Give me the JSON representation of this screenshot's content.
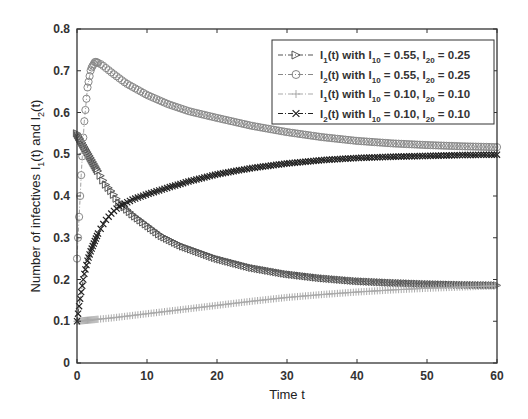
{
  "chart_data": {
    "type": "line",
    "title": "",
    "xlabel": "Time t",
    "ylabel": "Number of infectives I_1(t) and I_2(t)",
    "xlim": [
      0,
      60
    ],
    "ylim": [
      0,
      0.8
    ],
    "xticks": [
      0,
      10,
      20,
      30,
      40,
      50,
      60
    ],
    "yticks": [
      0,
      0.1,
      0.2,
      0.3,
      0.4,
      0.5,
      0.6,
      0.7,
      0.8
    ],
    "xtick_labels": [
      "0",
      "10",
      "20",
      "30",
      "40",
      "50",
      "60"
    ],
    "ytick_labels": [
      "0",
      "0.1",
      "0.2",
      "0.3",
      "0.4",
      "0.5",
      "0.6",
      "0.7",
      "0.8"
    ],
    "grid": false,
    "legend_position": "upper right",
    "series": [
      {
        "name": "I_1(t) with I_10 = 0.55, I_20 = 0.25",
        "marker": "triangle-right",
        "color": "#555555",
        "x": [
          0,
          1,
          2,
          3,
          4,
          5,
          6,
          8,
          10,
          12,
          15,
          20,
          25,
          30,
          35,
          40,
          45,
          50,
          55,
          60
        ],
        "y": [
          0.55,
          0.52,
          0.49,
          0.46,
          0.43,
          0.41,
          0.385,
          0.355,
          0.33,
          0.305,
          0.28,
          0.25,
          0.228,
          0.213,
          0.203,
          0.196,
          0.192,
          0.189,
          0.187,
          0.186
        ]
      },
      {
        "name": "I_2(t) with I_10 = 0.55, I_20 = 0.25",
        "marker": "circle",
        "color": "#888888",
        "x": [
          0,
          0.3,
          0.6,
          1,
          1.5,
          2,
          2.6,
          3.5,
          5,
          7,
          10,
          13,
          16,
          20,
          25,
          30,
          35,
          40,
          45,
          50,
          55,
          60
        ],
        "y": [
          0.25,
          0.35,
          0.45,
          0.57,
          0.66,
          0.705,
          0.722,
          0.715,
          0.695,
          0.67,
          0.642,
          0.62,
          0.603,
          0.587,
          0.568,
          0.553,
          0.541,
          0.532,
          0.526,
          0.522,
          0.519,
          0.517
        ]
      },
      {
        "name": "I_1(t) with I_10 = 0.10, I_20 = 0.10",
        "marker": "plus",
        "color": "#aaaaaa",
        "x": [
          0,
          5,
          10,
          15,
          20,
          25,
          30,
          35,
          40,
          45,
          50,
          55,
          60
        ],
        "y": [
          0.1,
          0.108,
          0.118,
          0.128,
          0.138,
          0.148,
          0.157,
          0.164,
          0.17,
          0.175,
          0.179,
          0.182,
          0.185
        ]
      },
      {
        "name": "I_2(t) with I_10 = 0.10, I_20 = 0.10",
        "marker": "x",
        "color": "#222222",
        "x": [
          0,
          0.5,
          1,
          1.5,
          2,
          3,
          4,
          5,
          6,
          8,
          10,
          13,
          16,
          20,
          25,
          30,
          35,
          40,
          45,
          50,
          55,
          60
        ],
        "y": [
          0.1,
          0.16,
          0.21,
          0.245,
          0.27,
          0.31,
          0.34,
          0.36,
          0.375,
          0.392,
          0.404,
          0.42,
          0.435,
          0.452,
          0.467,
          0.478,
          0.486,
          0.491,
          0.494,
          0.496,
          0.498,
          0.499
        ]
      }
    ]
  },
  "legend": {
    "items": [
      {
        "prefix": "I",
        "sub1": "1",
        "mid": "(t) with I",
        "sub2": "10",
        "mid2": " = 0.55, I",
        "sub3": "20",
        "tail": " = 0.25"
      },
      {
        "prefix": "I",
        "sub1": "2",
        "mid": "(t) with I",
        "sub2": "10",
        "mid2": " = 0.55, I",
        "sub3": "20",
        "tail": " = 0.25"
      },
      {
        "prefix": "I",
        "sub1": "1",
        "mid": "(t) with I",
        "sub2": "10",
        "mid2": " = 0.10, I",
        "sub3": "20",
        "tail": " = 0.10"
      },
      {
        "prefix": "I",
        "sub1": "2",
        "mid": "(t) with I",
        "sub2": "10",
        "mid2": " = 0.10, I",
        "sub3": "20",
        "tail": " = 0.10"
      }
    ]
  },
  "axes": {
    "xlabel": "Time t",
    "ylabel_main": "Number of infectives I",
    "ylabel_sub1": "1",
    "ylabel_mid": "(t) and I",
    "ylabel_sub2": "2",
    "ylabel_tail": "(t)"
  }
}
